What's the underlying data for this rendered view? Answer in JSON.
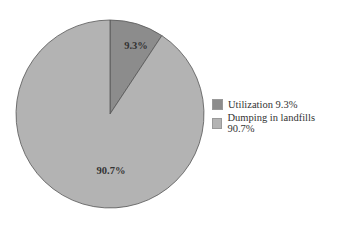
{
  "chart_data": {
    "type": "pie",
    "title": "",
    "categories": [
      "Utilization",
      "Dumping in landfills"
    ],
    "values": [
      9.3,
      90.7
    ],
    "unit": "%",
    "data_labels": [
      "9.3%",
      "90.7%"
    ],
    "colors": [
      "#8c8c8c",
      "#b3b3b3"
    ],
    "legend": {
      "position": "right",
      "entries": [
        "Utilization 9.3%",
        "Dumping in landfills 90.7%"
      ]
    },
    "start_angle": "12 o'clock, clockwise"
  }
}
